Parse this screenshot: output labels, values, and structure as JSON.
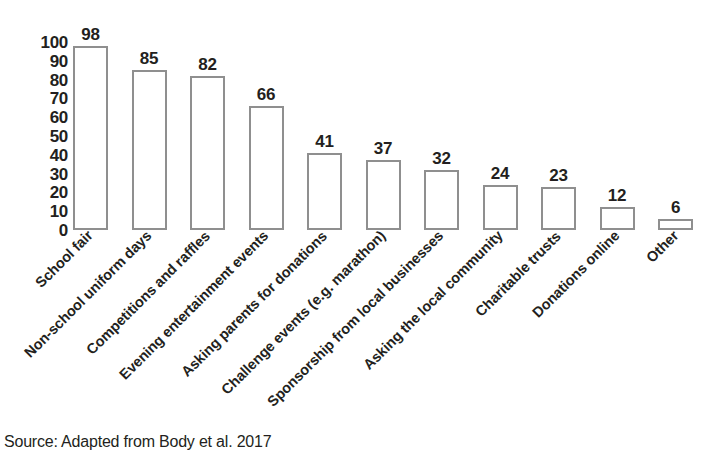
{
  "chart_data": {
    "type": "bar",
    "title": "",
    "subtitle": "",
    "xlabel": "",
    "ylabel": "",
    "ylim": [
      0,
      100
    ],
    "yticks": [
      100,
      90,
      80,
      70,
      60,
      50,
      40,
      30,
      20,
      10,
      0
    ],
    "grid": false,
    "legend": false,
    "legend_position": "none",
    "bar_style": "outlined-unfilled",
    "bar_outline_color": "#8f8f8f",
    "bar_fill_color": "#ffffff",
    "text_color": "#231f20",
    "value_labels_shown": true,
    "categories": [
      "School fair",
      "Non-school uniform days",
      "Competitions and raffles",
      "Evening entertainment events",
      "Asking parents for donations",
      "Challenge events (e.g. marathon)",
      "Sponsorship from local businesses",
      "Asking the local community",
      "Charitable trusts",
      "Donations online",
      "Other"
    ],
    "values": [
      98,
      85,
      82,
      66,
      41,
      37,
      32,
      24,
      23,
      12,
      6
    ]
  },
  "caption": {
    "source": "Source: Adapted from Body et al. 2017"
  }
}
